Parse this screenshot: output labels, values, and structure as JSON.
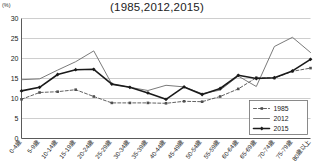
{
  "chart_data": {
    "type": "line",
    "title": "(1985,2012,2015)",
    "unit_label": "(%)",
    "xlabel": "",
    "ylabel": "",
    "ylim": [
      0,
      30
    ],
    "yticks": [
      0,
      5,
      10,
      15,
      20,
      25,
      30
    ],
    "ytick_labels": [
      "0",
      "5",
      "10",
      "15",
      "20",
      "25",
      "30"
    ],
    "grid": true,
    "legend_position": "bottom-right",
    "categories": [
      "0-4歳",
      "5-9歳",
      "10-14歳",
      "15-19歳",
      "20-24歳",
      "25-29歳",
      "30-34歳",
      "35-39歳",
      "40-44歳",
      "45-49歳",
      "50-54歳",
      "55-59歳",
      "60-64歳",
      "65-69歳",
      "70-74歳",
      "75-79歳",
      "80歳以上"
    ],
    "series": [
      {
        "name": "1985",
        "color": "#4f4f4f",
        "style": "dashed",
        "marker": "square",
        "values": [
          9.8,
          11.5,
          11.7,
          12.2,
          10.5,
          8.9,
          8.9,
          8.9,
          8.8,
          9.3,
          9.2,
          10.5,
          12.4,
          15.2,
          15.1,
          16.8,
          17.6
        ]
      },
      {
        "name": "2012",
        "color": "#6b6b6b",
        "style": "solid-thin",
        "marker": "none",
        "values": [
          14.7,
          14.9,
          17.1,
          19.2,
          21.9,
          13.6,
          12.8,
          12.0,
          13.3,
          12.9,
          11.2,
          12.1,
          15.6,
          13.0,
          23.0,
          25.3,
          21.5
        ]
      },
      {
        "name": "2015",
        "color": "#1a1a1a",
        "style": "solid-thick",
        "marker": "diamond",
        "values": [
          11.9,
          12.8,
          16.0,
          17.2,
          17.3,
          13.6,
          12.8,
          11.4,
          9.8,
          12.9,
          11.0,
          12.5,
          15.8,
          15.0,
          15.2,
          16.9,
          19.8
        ]
      }
    ]
  }
}
